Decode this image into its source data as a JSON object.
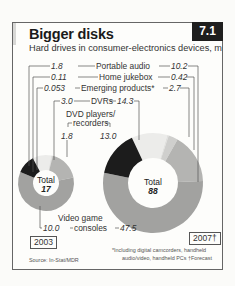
{
  "header": {
    "title": "Bigger disks",
    "badge": "7.1",
    "subtitle": "Hard drives in consumer-electronics devices, m"
  },
  "labels": {
    "portable_audio": "Portable audio",
    "home_jukebox": "Home jukebox",
    "emerging_products": "Emerging products*",
    "dvrs": "DVRs",
    "dvd_line1": "DVD players/",
    "dvd_line2": "recorders",
    "video_line1": "Video game",
    "video_line2": "consoles"
  },
  "values_2003": {
    "portable_audio": "1.8",
    "home_jukebox": "0.11",
    "emerging_products": "0.053",
    "dvrs": "3.0",
    "dvd": "1.8",
    "video_game": "10.0"
  },
  "values_2007": {
    "portable_audio": "10.2",
    "home_jukebox": "0.42",
    "emerging_products": "2.7",
    "dvrs": "14.3",
    "dvd": "13.0",
    "video_game": "47.5"
  },
  "totals": {
    "label": "Total",
    "y2003": "17",
    "y2007": "88"
  },
  "years": {
    "y2003": "2003",
    "y2007": "2007†"
  },
  "footnotes": {
    "source": "Source: In-Stat/MDR",
    "note_line1": "*Including digital camcorders, handheld",
    "note_line2": "audio/video, handheld PCs   †Forecast"
  },
  "chart_data": {
    "type": "pie",
    "title": "Bigger disks",
    "subtitle": "Hard drives in consumer-electronics devices, m",
    "categories": [
      "Portable audio",
      "Home jukebox",
      "Emerging products*",
      "DVRs",
      "Video game consoles",
      "DVD players/recorders"
    ],
    "series": [
      {
        "name": "2003",
        "total": 17,
        "values": [
          1.8,
          0.11,
          0.053,
          3.0,
          10.0,
          1.8
        ]
      },
      {
        "name": "2007 (forecast)",
        "total": 88,
        "values": [
          10.2,
          0.42,
          2.7,
          14.3,
          47.5,
          13.0
        ]
      }
    ],
    "colors": [
      "#ececea",
      "#e0e0de",
      "#cfcfcd",
      "#b4b4b2",
      "#a2a2a0",
      "#1c1c1c"
    ],
    "donut": true,
    "annotations": [
      "*Including digital camcorders, handheld audio/video, handheld PCs",
      "†Forecast",
      "Source: In-Stat/MDR"
    ]
  }
}
